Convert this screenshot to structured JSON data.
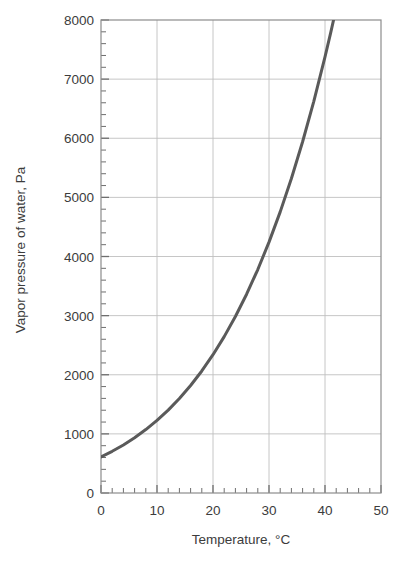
{
  "chart_data": {
    "type": "line",
    "title": "",
    "subtitle": "",
    "xlabel": "Temperature, °C",
    "ylabel": "Vapor pressure of water, Pa",
    "xlim": [
      0,
      50
    ],
    "ylim": [
      0,
      8000
    ],
    "grid": true,
    "legend_position": "none",
    "x_major_ticks": [
      0,
      10,
      20,
      30,
      40,
      50
    ],
    "x_tick_labels": [
      "0",
      "10",
      "20",
      "30",
      "40",
      "50"
    ],
    "x_minor_tick_step": 2,
    "y_major_ticks": [
      0,
      1000,
      2000,
      3000,
      4000,
      5000,
      6000,
      7000,
      8000
    ],
    "y_tick_labels": [
      "0",
      "1000",
      "2000",
      "3000",
      "4000",
      "5000",
      "6000",
      "7000",
      "8000"
    ],
    "y_minor_tick_step": 200,
    "series": [
      {
        "name": "Saturation vapor pressure of water",
        "color": "#5a5a5a",
        "line_width": 3,
        "x": [
          0,
          2,
          4,
          6,
          8,
          10,
          12,
          14,
          16,
          18,
          20,
          22,
          24,
          26,
          28,
          30,
          32,
          34,
          36,
          38,
          40,
          41,
          42
        ],
        "y": [
          611,
          705,
          813,
          935,
          1073,
          1228,
          1402,
          1598,
          1818,
          2064,
          2339,
          2645,
          2985,
          3362,
          3780,
          4243,
          4755,
          5320,
          5941,
          6625,
          7375,
          7778,
          8199
        ]
      }
    ],
    "annotations": []
  },
  "axes": {
    "frame_color": "#8c8c8c",
    "grid_color": "#bfbfbf",
    "tick_color": "#6e6e6e",
    "background": "#ffffff"
  },
  "icons": {
    "chart_icon": "line-chart-icon"
  }
}
